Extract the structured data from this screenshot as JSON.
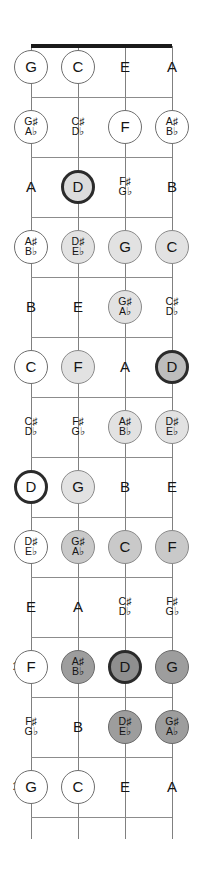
{
  "diagram": {
    "instrument": "ukulele",
    "tuning": [
      "G",
      "C",
      "E",
      "A"
    ],
    "string_count": 4,
    "fret_count": 12,
    "colors": {
      "nut": "#1a1a1a",
      "string": "#808080",
      "fret_wire": "#8c8c8c",
      "marker_white": "#ffffff",
      "marker_light": "#e2e2e2",
      "marker_medium": "#c9c9c9",
      "marker_dark": "#9d9d9d",
      "root_ring": "#2b2b2b",
      "text": "#141414",
      "background": "#ffffff"
    },
    "fret_numbers": [
      "5",
      "7",
      "10",
      "12"
    ],
    "rows": [
      {
        "fret": 0,
        "fret_label": "",
        "notes": [
          {
            "name": "G",
            "sharp": "",
            "flat": "",
            "marker": "white"
          },
          {
            "name": "C",
            "sharp": "",
            "flat": "",
            "marker": "white"
          },
          {
            "name": "E",
            "sharp": "",
            "flat": "",
            "marker": "none"
          },
          {
            "name": "A",
            "sharp": "",
            "flat": "",
            "marker": "none"
          }
        ]
      },
      {
        "fret": 1,
        "fret_label": "",
        "notes": [
          {
            "name": "",
            "sharp": "G♯",
            "flat": "A♭",
            "marker": "white"
          },
          {
            "name": "",
            "sharp": "C♯",
            "flat": "D♭",
            "marker": "none"
          },
          {
            "name": "F",
            "sharp": "",
            "flat": "",
            "marker": "white"
          },
          {
            "name": "",
            "sharp": "A♯",
            "flat": "B♭",
            "marker": "white"
          }
        ]
      },
      {
        "fret": 2,
        "fret_label": "",
        "notes": [
          {
            "name": "A",
            "sharp": "",
            "flat": "",
            "marker": "none"
          },
          {
            "name": "D",
            "sharp": "",
            "flat": "",
            "marker": "light",
            "root": true
          },
          {
            "name": "",
            "sharp": "F♯",
            "flat": "G♭",
            "marker": "none"
          },
          {
            "name": "B",
            "sharp": "",
            "flat": "",
            "marker": "none"
          }
        ]
      },
      {
        "fret": 3,
        "fret_label": "",
        "notes": [
          {
            "name": "",
            "sharp": "A♯",
            "flat": "B♭",
            "marker": "white"
          },
          {
            "name": "",
            "sharp": "D♯",
            "flat": "E♭",
            "marker": "light"
          },
          {
            "name": "G",
            "sharp": "",
            "flat": "",
            "marker": "light"
          },
          {
            "name": "C",
            "sharp": "",
            "flat": "",
            "marker": "light"
          }
        ]
      },
      {
        "fret": 4,
        "fret_label": "",
        "notes": [
          {
            "name": "B",
            "sharp": "",
            "flat": "",
            "marker": "none"
          },
          {
            "name": "E",
            "sharp": "",
            "flat": "",
            "marker": "none"
          },
          {
            "name": "",
            "sharp": "G♯",
            "flat": "A♭",
            "marker": "light"
          },
          {
            "name": "",
            "sharp": "C♯",
            "flat": "D♭",
            "marker": "none"
          }
        ]
      },
      {
        "fret": 5,
        "fret_label": "5",
        "notes": [
          {
            "name": "C",
            "sharp": "",
            "flat": "",
            "marker": "white"
          },
          {
            "name": "F",
            "sharp": "",
            "flat": "",
            "marker": "light"
          },
          {
            "name": "A",
            "sharp": "",
            "flat": "",
            "marker": "none"
          },
          {
            "name": "D",
            "sharp": "",
            "flat": "",
            "marker": "med",
            "root": true
          }
        ]
      },
      {
        "fret": 6,
        "fret_label": "",
        "notes": [
          {
            "name": "",
            "sharp": "C♯",
            "flat": "D♭",
            "marker": "none"
          },
          {
            "name": "",
            "sharp": "F♯",
            "flat": "G♭",
            "marker": "none"
          },
          {
            "name": "",
            "sharp": "A♯",
            "flat": "B♭",
            "marker": "light"
          },
          {
            "name": "",
            "sharp": "D♯",
            "flat": "E♭",
            "marker": "light"
          }
        ]
      },
      {
        "fret": 7,
        "fret_label": "7",
        "notes": [
          {
            "name": "D",
            "sharp": "",
            "flat": "",
            "marker": "white",
            "root": true
          },
          {
            "name": "G",
            "sharp": "",
            "flat": "",
            "marker": "light"
          },
          {
            "name": "B",
            "sharp": "",
            "flat": "",
            "marker": "none"
          },
          {
            "name": "E",
            "sharp": "",
            "flat": "",
            "marker": "none"
          }
        ]
      },
      {
        "fret": 8,
        "fret_label": "",
        "notes": [
          {
            "name": "",
            "sharp": "D♯",
            "flat": "E♭",
            "marker": "white"
          },
          {
            "name": "",
            "sharp": "G♯",
            "flat": "A♭",
            "marker": "med"
          },
          {
            "name": "C",
            "sharp": "",
            "flat": "",
            "marker": "med"
          },
          {
            "name": "F",
            "sharp": "",
            "flat": "",
            "marker": "med"
          }
        ]
      },
      {
        "fret": 9,
        "fret_label": "",
        "notes": [
          {
            "name": "E",
            "sharp": "",
            "flat": "",
            "marker": "none"
          },
          {
            "name": "A",
            "sharp": "",
            "flat": "",
            "marker": "none"
          },
          {
            "name": "",
            "sharp": "C♯",
            "flat": "D♭",
            "marker": "none"
          },
          {
            "name": "",
            "sharp": "F♯",
            "flat": "G♭",
            "marker": "none"
          }
        ]
      },
      {
        "fret": 10,
        "fret_label": "10",
        "notes": [
          {
            "name": "F",
            "sharp": "",
            "flat": "",
            "marker": "white"
          },
          {
            "name": "",
            "sharp": "A♯",
            "flat": "B♭",
            "marker": "dark"
          },
          {
            "name": "D",
            "sharp": "",
            "flat": "",
            "marker": "dark",
            "root": true
          },
          {
            "name": "G",
            "sharp": "",
            "flat": "",
            "marker": "dark"
          }
        ]
      },
      {
        "fret": 11,
        "fret_label": "",
        "notes": [
          {
            "name": "",
            "sharp": "F♯",
            "flat": "G♭",
            "marker": "none"
          },
          {
            "name": "B",
            "sharp": "",
            "flat": "",
            "marker": "none"
          },
          {
            "name": "",
            "sharp": "D♯",
            "flat": "E♭",
            "marker": "dark"
          },
          {
            "name": "",
            "sharp": "G♯",
            "flat": "A♭",
            "marker": "dark"
          }
        ]
      },
      {
        "fret": 12,
        "fret_label": "12",
        "notes": [
          {
            "name": "G",
            "sharp": "",
            "flat": "",
            "marker": "white"
          },
          {
            "name": "C",
            "sharp": "",
            "flat": "",
            "marker": "white"
          },
          {
            "name": "E",
            "sharp": "",
            "flat": "",
            "marker": "none"
          },
          {
            "name": "A",
            "sharp": "",
            "flat": "",
            "marker": "none"
          }
        ]
      }
    ]
  }
}
